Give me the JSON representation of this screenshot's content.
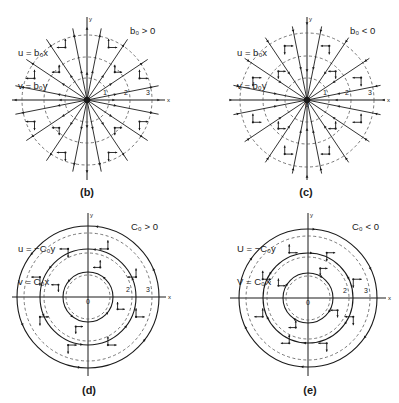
{
  "figure": {
    "panels": [
      {
        "id": "b",
        "label": "(b)",
        "type": "radial",
        "equation_lines": [
          "u = b₀x",
          "v = b₀y"
        ],
        "condition": "b₀ > 0",
        "flow_direction": "outward",
        "center": [
          87,
          100
        ],
        "dashed_radii": [
          22,
          43,
          65
        ],
        "solid_radii": [],
        "axis_extent": {
          "x": [
            12,
            165
          ],
          "y": [
            17,
            180
          ]
        },
        "ray_count": 16,
        "ring_labels": [
          "1",
          "2",
          "3"
        ],
        "origin_label": "",
        "label_pos": [
          87,
          186
        ],
        "eq_pos": [
          18,
          25
        ],
        "cond_pos": [
          132,
          25
        ]
      },
      {
        "id": "c",
        "label": "(c)",
        "type": "radial",
        "equation_lines": [
          "u = b₀x",
          "v = b₀y"
        ],
        "condition": "b₀ < 0",
        "flow_direction": "inward",
        "center": [
          307,
          100
        ],
        "dashed_radii": [
          22,
          44,
          67
        ],
        "solid_radii": [],
        "axis_extent": {
          "x": [
            230,
            385
          ],
          "y": [
            17,
            180
          ]
        },
        "ray_count": 16,
        "ring_labels": [
          "1",
          "2",
          "3"
        ],
        "origin_label": "0",
        "label_pos": [
          306,
          186
        ],
        "eq_pos": [
          237,
          25
        ],
        "cond_pos": [
          352,
          25
        ]
      },
      {
        "id": "d",
        "label": "(d)",
        "type": "rotation",
        "equation_lines": [
          "u = −C₀y",
          "v = C₀x"
        ],
        "condition": "C₀ > 0",
        "flow_direction": "counterclockwise",
        "center": [
          88,
          297
        ],
        "dashed_radii": [
          22,
          44,
          64
        ],
        "solid_radii": [
          25,
          48,
          71
        ],
        "axis_extent": {
          "x": [
            12,
            166
          ],
          "y": [
            213,
            376
          ]
        },
        "ring_labels": [
          "2",
          "3"
        ],
        "origin_label": "0",
        "label_pos": [
          89,
          384
        ],
        "eq_pos": [
          18,
          221
        ],
        "cond_pos": [
          131,
          221
        ]
      },
      {
        "id": "e",
        "label": "(e)",
        "type": "rotation",
        "equation_lines": [
          "U = −C₀y",
          "V = C₀X"
        ],
        "condition": "C₀ < 0",
        "flow_direction": "clockwise",
        "center": [
          308,
          298
        ],
        "dashed_radii": [
          22,
          41,
          62
        ],
        "solid_radii": [
          25,
          45,
          69
        ],
        "axis_extent": {
          "x": [
            230,
            386
          ],
          "y": [
            213,
            376
          ]
        },
        "ring_labels": [
          "2",
          "3"
        ],
        "origin_label": "0",
        "label_pos": [
          310,
          384
        ],
        "eq_pos": [
          237,
          221
        ],
        "cond_pos": [
          352,
          221
        ]
      }
    ],
    "axis_labels": {
      "x": "x",
      "y": "y"
    },
    "colors": {
      "ink": "#1a1a1a",
      "dashed": "#555555",
      "background": "#ffffff"
    }
  }
}
